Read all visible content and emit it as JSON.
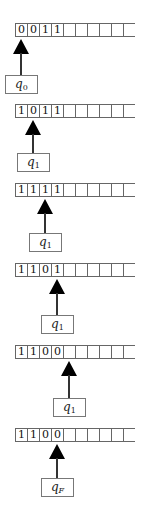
{
  "diagram": {
    "type": "turing-machine-trace",
    "tape_length_visible": 10,
    "steps": [
      {
        "tape": [
          "0",
          "0",
          "1",
          "1",
          "",
          "",
          "",
          "",
          "",
          ""
        ],
        "head_index": 0,
        "state": "q",
        "state_sub": "0"
      },
      {
        "tape": [
          "1",
          "0",
          "1",
          "1",
          "",
          "",
          "",
          "",
          "",
          ""
        ],
        "head_index": 1,
        "state": "q",
        "state_sub": "1"
      },
      {
        "tape": [
          "1",
          "1",
          "1",
          "1",
          "",
          "",
          "",
          "",
          "",
          ""
        ],
        "head_index": 2,
        "state": "q",
        "state_sub": "1"
      },
      {
        "tape": [
          "1",
          "1",
          "0",
          "1",
          "",
          "",
          "",
          "",
          "",
          ""
        ],
        "head_index": 3,
        "state": "q",
        "state_sub": "1"
      },
      {
        "tape": [
          "1",
          "1",
          "0",
          "0",
          "",
          "",
          "",
          "",
          "",
          ""
        ],
        "head_index": 4,
        "state": "q",
        "state_sub": "1"
      },
      {
        "tape": [
          "1",
          "1",
          "0",
          "0",
          "",
          "",
          "",
          "",
          "",
          ""
        ],
        "head_index": 3,
        "state": "q",
        "state_sub": "F"
      }
    ]
  }
}
